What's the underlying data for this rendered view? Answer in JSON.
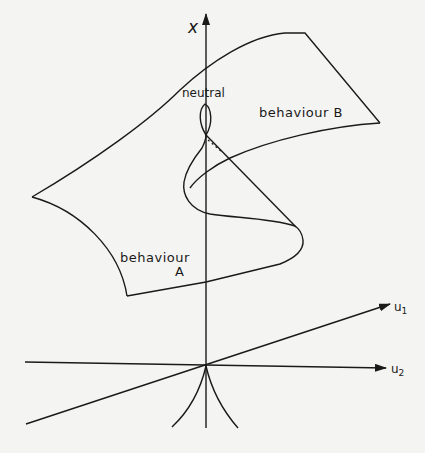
{
  "diagram": {
    "type": "cusp catastrophe surface",
    "axis_labels": {
      "vertical": "x",
      "u1": "u",
      "u1_sub": "1",
      "u2": "u",
      "u2_sub": "2"
    },
    "region_labels": {
      "neutral": "neutral",
      "behaviour_b": "behaviour B",
      "behaviour_a_line1": "behaviour",
      "behaviour_a_line2": "A"
    },
    "colors": {
      "background": "#f4f4f2",
      "ink": "#1a1a1a"
    }
  }
}
